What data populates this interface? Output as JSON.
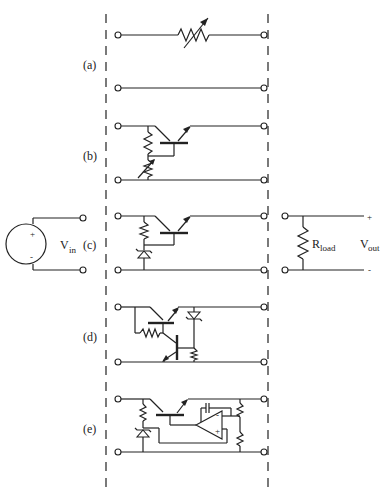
{
  "diagram": {
    "source": {
      "label": "V",
      "subscript": "in",
      "plus": "+",
      "minus": "-"
    },
    "load": {
      "label": "R",
      "subscript": "load",
      "out_label": "V",
      "out_subscript": "out",
      "plus": "+",
      "minus": "-"
    },
    "variants": [
      {
        "id": "a",
        "label": "(a)",
        "elements": [
          "variable resistor"
        ]
      },
      {
        "id": "b",
        "label": "(b)",
        "elements": [
          "NPN pass transistor",
          "resistor",
          "variable resistor"
        ]
      },
      {
        "id": "c",
        "label": "(c)",
        "elements": [
          "NPN pass transistor",
          "resistor",
          "zener diode"
        ]
      },
      {
        "id": "d",
        "label": "(d)",
        "elements": [
          "NPN pass transistor",
          "resistor",
          "NPN sense transistor",
          "zener diode",
          "resistor"
        ]
      },
      {
        "id": "e",
        "label": "(e)",
        "elements": [
          "NPN pass transistor",
          "resistor",
          "zener diode",
          "op-amp",
          "capacitor",
          "voltage divider resistors"
        ]
      }
    ],
    "colors": {
      "line": "#222222",
      "background": "#ffffff"
    }
  }
}
